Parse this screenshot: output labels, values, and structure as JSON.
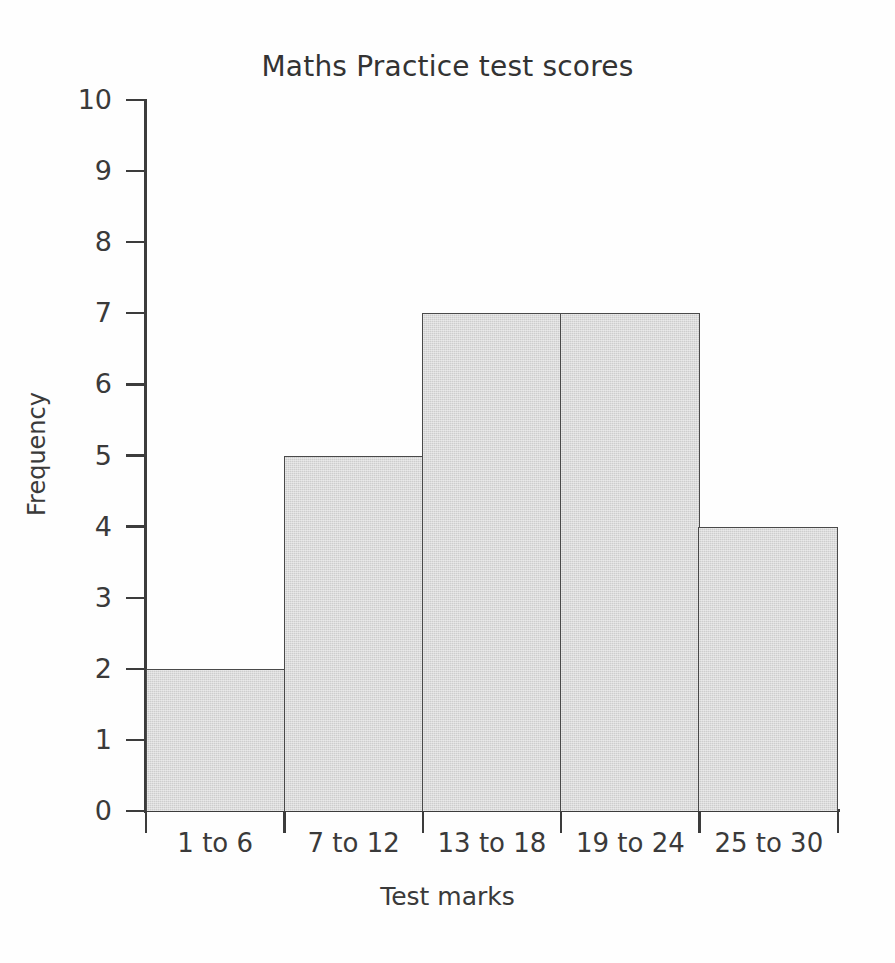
{
  "chart_data": {
    "type": "bar",
    "title": "Maths Practice test scores",
    "xlabel": "Test marks",
    "ylabel": "Frequency",
    "categories": [
      "1 to 6",
      "7 to 12",
      "13 to 18",
      "19 to 24",
      "25 to 30"
    ],
    "values": [
      2,
      5,
      7,
      7,
      4
    ],
    "ylim": [
      0,
      10
    ],
    "ytick_labels": [
      "0",
      "1",
      "2",
      "3",
      "4",
      "5",
      "6",
      "7",
      "8",
      "9",
      "10"
    ],
    "ytick_values": [
      0,
      1,
      2,
      3,
      4,
      5,
      6,
      7,
      8,
      9,
      10
    ],
    "grid": false,
    "legend": false,
    "bar_fill_color": "#cdcdcd",
    "bar_edge_color": "#4a4a4a",
    "axis_color": "#3c3c3c",
    "text_color": "#3a3a3a",
    "background_color": "#fefefe"
  }
}
